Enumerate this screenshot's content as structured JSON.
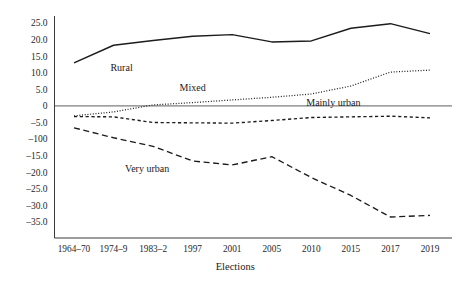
{
  "chart_data": {
    "type": "line",
    "title": "",
    "xlabel": "Elections",
    "ylabel": "",
    "grid": false,
    "legend": "inline-labels",
    "categories": [
      "1964–70",
      "1974–9",
      "1983–2",
      "1997",
      "2001",
      "2005",
      "2010",
      "2015",
      "2017",
      "2019"
    ],
    "ylim": [
      -35,
      25
    ],
    "yticks": [
      25,
      20,
      15,
      10,
      5,
      0,
      -5,
      -10,
      -15,
      -20,
      -25,
      -30,
      -35
    ],
    "ytick_labels": [
      "25.0",
      "20.0",
      "15.0",
      "10.0",
      "5.0",
      "0",
      "–5.0",
      "–100",
      "–15.0",
      "–20.0",
      "–25.0",
      "–30.0",
      "–35.0"
    ],
    "series": [
      {
        "name": "Rural",
        "style": "solid",
        "label": "Rural",
        "label_x_category": "1974–9",
        "values": [
          13.0,
          18.3,
          19.7,
          21.0,
          21.5,
          19.3,
          19.6,
          23.4,
          24.8,
          21.8
        ]
      },
      {
        "name": "Mixed",
        "style": "dotted",
        "label": "Mixed",
        "label_x_category": "1997",
        "values": [
          -3.0,
          -1.8,
          0.3,
          1.0,
          1.8,
          2.6,
          3.6,
          6.0,
          10.2,
          10.8
        ]
      },
      {
        "name": "Mainly urban",
        "style": "dashed",
        "label": "Mainly urban",
        "label_x_category": "2010",
        "values": [
          -3.2,
          -3.3,
          -5.0,
          -5.1,
          -5.2,
          -4.4,
          -3.5,
          -3.3,
          -3.1,
          -3.6
        ]
      },
      {
        "name": "Very urban",
        "style": "long-dashed",
        "label": "Very urban",
        "label_x_category": "1983–2",
        "values": [
          -6.6,
          -9.6,
          -12.2,
          -16.6,
          -17.8,
          -15.3,
          -21.6,
          -27.0,
          -33.5,
          -33.0
        ]
      }
    ]
  }
}
